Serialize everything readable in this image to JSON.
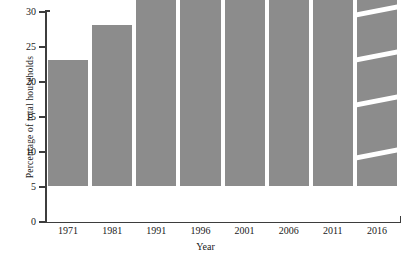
{
  "chart_data": {
    "type": "bar",
    "title": "",
    "xlabel": "Year",
    "ylabel": "Percentage of total households",
    "categories": [
      "1971",
      "1981",
      "1991",
      "1996",
      "2001",
      "2006",
      "2011",
      "2016"
    ],
    "values": [
      18,
      23,
      27,
      29,
      28,
      28,
      28.8,
      30
    ],
    "ylim": [
      0,
      30
    ],
    "yticks": [
      "0",
      "5",
      "10",
      "15",
      "20",
      "25",
      "30"
    ],
    "ytick_values": [
      0,
      5,
      10,
      15,
      20,
      25,
      30
    ],
    "grid": false,
    "legend": "none",
    "bar_color": "#8c8c8c",
    "axis_color": "#3d3d3d",
    "background": "#ffffff",
    "annotations": [
      "The 2016 bar is drawn with four white diagonal slashes across it, distinguishing it from the solid bars."
    ],
    "series": [
      {
        "name": "Percentage of total households",
        "values": [
          18,
          23,
          27,
          29,
          28,
          28,
          28.8,
          30
        ]
      }
    ]
  }
}
